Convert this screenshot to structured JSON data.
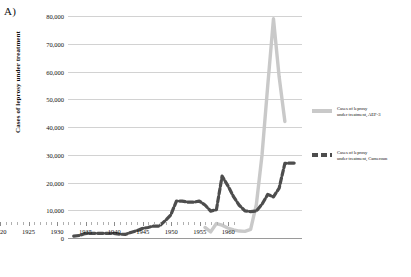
{
  "panel": {
    "label": "A)"
  },
  "chart_data": {
    "type": "line",
    "title": "",
    "xlabel": "",
    "ylabel": "Cases of leprosy under treatment",
    "xlim": [
      1920,
      1961
    ],
    "ylim": [
      0,
      80000
    ],
    "ytick_labels": [
      "0",
      "10,000",
      "20,000",
      "30,000",
      "40,000",
      "50,000",
      "60,000",
      "70,000",
      "80,000"
    ],
    "ytick_values": [
      0,
      10000,
      20000,
      30000,
      40000,
      50000,
      60000,
      70000,
      80000
    ],
    "xtick_labels": [
      "1920",
      "1925",
      "1930",
      "1935",
      "1940",
      "1945",
      "1950",
      "1955",
      "1960"
    ],
    "xtick_values": [
      1920,
      1925,
      1930,
      1935,
      1940,
      1945,
      1950,
      1955,
      1960
    ],
    "grid": "horizontal",
    "legend_position": "right",
    "series": [
      {
        "name": "Cases of leprosy under treatment, AEF-3",
        "legend_line1": "Cases of leprosy",
        "legend_line2": "under treatment, AEF-3",
        "color": "#c9c9c9",
        "style": "solid",
        "x": [
          1944,
          1945,
          1946,
          1947,
          1948,
          1949,
          1950,
          1951,
          1952,
          1953,
          1954,
          1955,
          1956,
          1957,
          1958
        ],
        "y": [
          3800,
          2200,
          5200,
          4600,
          3600,
          2900,
          2500,
          2400,
          3100,
          12000,
          30000,
          55000,
          79000,
          58000,
          42000
        ]
      },
      {
        "name": "Cases of leprosy under treatment, Cameroun",
        "legend_line1": "Cases of leprosy",
        "legend_line2": "under treatment, Cameroun",
        "color": "#4d4d4d",
        "style": "dashed",
        "x": [
          1921,
          1922,
          1923,
          1924,
          1925,
          1926,
          1927,
          1928,
          1929,
          1930,
          1931,
          1932,
          1933,
          1934,
          1935,
          1936,
          1937,
          1938,
          1939,
          1940,
          1941,
          1942,
          1943,
          1944,
          1945,
          1946,
          1947,
          1948,
          1949,
          1950,
          1951,
          1952,
          1953,
          1954,
          1955,
          1956,
          1957,
          1958,
          1959,
          1960
        ],
        "y": [
          700,
          900,
          1600,
          1700,
          1700,
          1700,
          1700,
          1700,
          1400,
          1300,
          2000,
          2600,
          3400,
          3800,
          4300,
          4300,
          6200,
          8300,
          13300,
          13300,
          12900,
          12900,
          13300,
          11900,
          9700,
          10200,
          22300,
          18900,
          14900,
          11800,
          9800,
          9500,
          9700,
          12200,
          15700,
          14800,
          18000,
          26900,
          27000,
          27000
        ]
      }
    ]
  }
}
